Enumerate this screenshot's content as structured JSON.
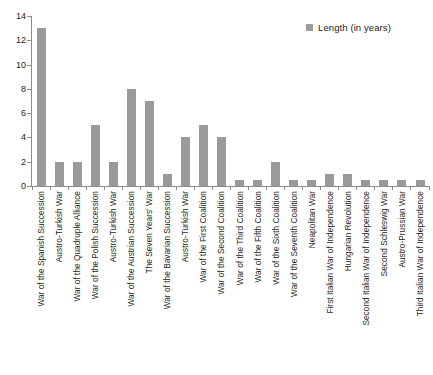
{
  "chart_data": {
    "type": "bar",
    "title": "",
    "xlabel": "",
    "ylabel": "",
    "ylim": [
      0,
      14
    ],
    "yticks": [
      0,
      2,
      4,
      6,
      8,
      10,
      12,
      14
    ],
    "grid": false,
    "legend": {
      "position": "top-right",
      "entries": [
        {
          "name": "Length (in years)",
          "color": "#9a9a9a"
        }
      ]
    },
    "series": [
      {
        "name": "Length (in years)",
        "color": "#9a9a9a",
        "values": [
          13,
          2,
          2,
          5,
          2,
          8,
          7,
          1,
          4,
          5,
          4,
          0.5,
          0.5,
          2,
          0.5,
          0.5,
          1,
          1,
          0.5,
          0.5,
          0.5,
          0.5
        ]
      }
    ],
    "categories": [
      "War of the Spanish Succession",
      "Austro-Turkish War",
      "War of the Quadruple Alliance",
      "War of the Polish Succession",
      "Austro-Turkish War",
      "War of the Austrian Succession",
      "The Seven Years' War",
      "War of the Bavarian Succession",
      "Austro-Turkish War",
      "War of the First Coalition",
      "War of the Second Coalition",
      "War of the Third Coalition",
      "War of the Fifth Coalition",
      "War of the Sixth Coalition",
      "War of the Seventh Coalition",
      "Neapolitan War",
      "First Italian War of Independence",
      "Hungarian Revolution",
      "Second Italian War of Independence",
      "Second Schleswig War",
      "Austro-Prussian War",
      "Third Italian War of Independence"
    ]
  },
  "colors": {
    "bar": "#9a9a9a",
    "axis": "#8c8c8c",
    "text": "#231f20",
    "background": "#ffffff"
  }
}
